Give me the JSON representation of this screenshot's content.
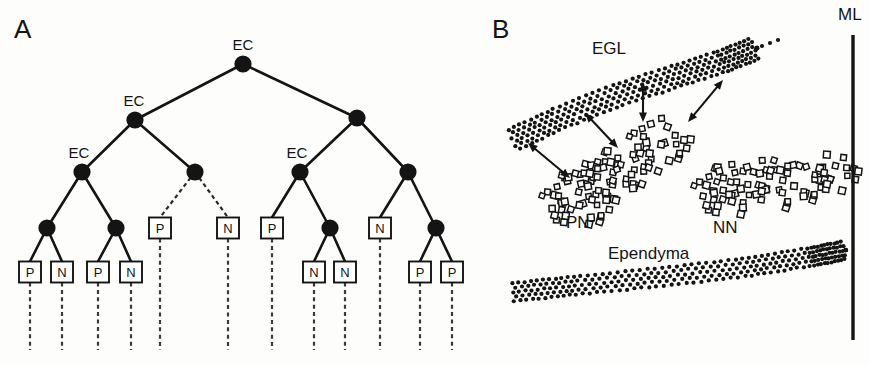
{
  "figure": {
    "panels": [
      {
        "id": "A",
        "label": "A"
      },
      {
        "id": "B",
        "label": "B"
      }
    ]
  },
  "panelA": {
    "label": "A",
    "description": "Binary lineage tree of cell divisions",
    "node_label_ec": "EC",
    "leaf_p": "P",
    "leaf_n": "N",
    "nodes": [
      {
        "id": "r",
        "x": 243,
        "y": 64,
        "label": "EC",
        "label_dx": 0,
        "label_dy": -14
      },
      {
        "id": "l1",
        "x": 135,
        "y": 120,
        "label": "EC",
        "label_dx": -1,
        "label_dy": -14
      },
      {
        "id": "r1",
        "x": 357,
        "y": 118,
        "label": "",
        "label_dx": 0,
        "label_dy": -14
      },
      {
        "id": "l2a",
        "x": 82,
        "y": 172,
        "label": "EC",
        "label_dx": -3,
        "label_dy": -14
      },
      {
        "id": "l2b",
        "x": 195,
        "y": 172,
        "label": "",
        "label_dx": 0,
        "label_dy": -14
      },
      {
        "id": "r2a",
        "x": 300,
        "y": 172,
        "label": "EC",
        "label_dx": -3,
        "label_dy": -14
      },
      {
        "id": "r2b",
        "x": 408,
        "y": 172,
        "label": "",
        "label_dx": 0,
        "label_dy": -14
      },
      {
        "id": "l3a",
        "x": 47,
        "y": 228,
        "label": "",
        "label_dx": 0,
        "label_dy": -14
      },
      {
        "id": "l3b",
        "x": 116,
        "y": 228,
        "label": "",
        "label_dx": 0,
        "label_dy": -14
      },
      {
        "id": "r3a",
        "x": 330,
        "y": 228,
        "label": "",
        "label_dx": 0,
        "label_dy": -14
      },
      {
        "id": "r3b",
        "x": 436,
        "y": 228,
        "label": "",
        "label_dx": 0,
        "label_dy": -14
      }
    ],
    "edges": [
      {
        "from": "r",
        "to": "l1",
        "style": "solid"
      },
      {
        "from": "r",
        "to": "r1",
        "style": "solid"
      },
      {
        "from": "l1",
        "to": "l2a",
        "style": "solid"
      },
      {
        "from": "l1",
        "to": "l2b",
        "style": "solid"
      },
      {
        "from": "r1",
        "to": "r2a",
        "style": "solid"
      },
      {
        "from": "r1",
        "to": "r2b",
        "style": "solid"
      },
      {
        "from": "l2a",
        "to": "l3a",
        "style": "solid"
      },
      {
        "from": "l2a",
        "to": "l3b",
        "style": "solid"
      },
      {
        "from": "r2a",
        "to": "r3a",
        "style": "solid"
      },
      {
        "from": "r2b",
        "to": "r3b",
        "style": "solid"
      }
    ],
    "leaves": [
      {
        "id": "b1",
        "x": 30,
        "y": 272,
        "text": "P",
        "parent": "l3a",
        "edge": "solid",
        "descender_to": 350
      },
      {
        "id": "b2",
        "x": 62,
        "y": 272,
        "text": "N",
        "parent": "l3a",
        "edge": "solid",
        "descender_to": 350
      },
      {
        "id": "b3",
        "x": 98,
        "y": 272,
        "text": "P",
        "parent": "l3b",
        "edge": "solid",
        "descender_to": 350
      },
      {
        "id": "b4",
        "x": 131,
        "y": 272,
        "text": "N",
        "parent": "l3b",
        "edge": "solid",
        "descender_to": 350
      },
      {
        "id": "b5",
        "x": 160,
        "y": 228,
        "text": "P",
        "parent": "l2b",
        "edge": "dashed",
        "descender_to": 350
      },
      {
        "id": "b6",
        "x": 228,
        "y": 228,
        "text": "N",
        "parent": "l2b",
        "edge": "dashed",
        "descender_to": 350
      },
      {
        "id": "b7",
        "x": 272,
        "y": 228,
        "text": "P",
        "parent": "r2a",
        "edge": "solid",
        "descender_to": 350
      },
      {
        "id": "b8",
        "x": 314,
        "y": 272,
        "text": "N",
        "parent": "r3a",
        "edge": "solid",
        "descender_to": 350
      },
      {
        "id": "b9",
        "x": 345,
        "y": 272,
        "text": "N",
        "parent": "r3a",
        "edge": "solid",
        "descender_to": 350
      },
      {
        "id": "b10",
        "x": 380,
        "y": 228,
        "text": "N",
        "parent": "r2b",
        "edge": "solid",
        "descender_to": 350
      },
      {
        "id": "b11",
        "x": 420,
        "y": 272,
        "text": "P",
        "parent": "r3b",
        "edge": "solid",
        "descender_to": 350
      },
      {
        "id": "b12",
        "x": 452,
        "y": 272,
        "text": "P",
        "parent": "r3b",
        "edge": "solid",
        "descender_to": 350
      }
    ]
  },
  "panelB": {
    "label": "B",
    "description": "Schematic of cerebellar external granular layer, proliferative and nonproliferative neuroblast zones",
    "labels": {
      "egl": "EGL",
      "pn": "PN",
      "nn": "NN",
      "ependyma": "Ependyma",
      "ml": "ML"
    },
    "label_positions": {
      "egl": {
        "x": 592,
        "y": 54
      },
      "pn": {
        "x": 566,
        "y": 228
      },
      "nn": {
        "x": 713,
        "y": 233
      },
      "ependyma": {
        "x": 608,
        "y": 259
      },
      "ml": {
        "x": 838,
        "y": 20
      }
    },
    "ml_line": {
      "x": 853,
      "y1": 35,
      "y2": 340
    },
    "arrows": [
      {
        "x1": 570,
        "y1": 178,
        "x2": 528,
        "y2": 143
      },
      {
        "x1": 618,
        "y1": 148,
        "x2": 585,
        "y2": 113
      },
      {
        "x1": 643,
        "y1": 122,
        "x2": 643,
        "y2": 82
      },
      {
        "x1": 688,
        "y1": 122,
        "x2": 723,
        "y2": 80
      }
    ]
  },
  "colors": {
    "ink": "#141414",
    "background": "#fdfdfb",
    "cell_fill": "#ffffff"
  }
}
